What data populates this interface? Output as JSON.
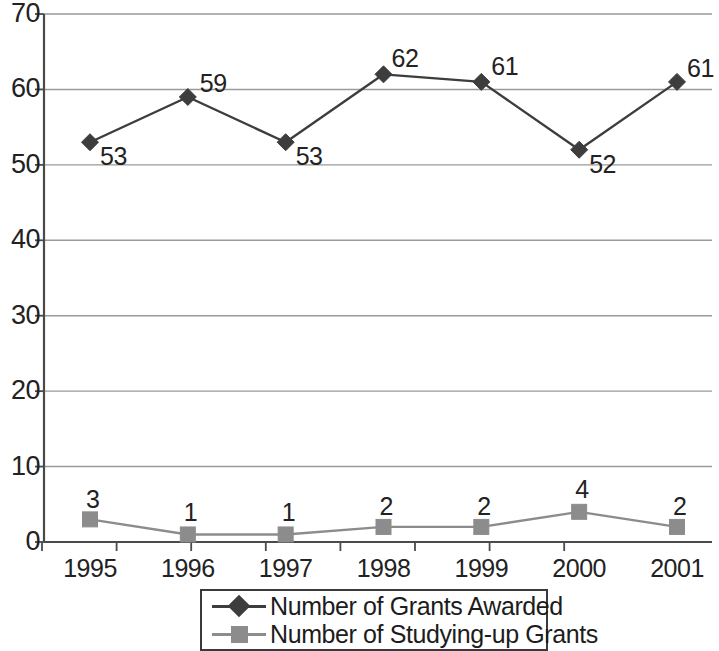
{
  "chart_data": {
    "type": "line",
    "title": "",
    "xlabel": "",
    "ylabel": "",
    "categories": [
      "1995",
      "1996",
      "1997",
      "1998",
      "1999",
      "2000",
      "2001"
    ],
    "series": [
      {
        "name": "Number of Grants Awarded",
        "marker": "diamond",
        "color": "#3d3d3d",
        "values": [
          53,
          59,
          53,
          62,
          61,
          52,
          61
        ],
        "label_offsets": [
          {
            "dx": 10,
            "dy": 2
          },
          {
            "dx": 12,
            "dy": -26
          },
          {
            "dx": 10,
            "dy": 2
          },
          {
            "dx": 8,
            "dy": -28
          },
          {
            "dx": 10,
            "dy": -28
          },
          {
            "dx": 10,
            "dy": 2
          },
          {
            "dx": 10,
            "dy": -26
          }
        ]
      },
      {
        "name": "Number of Studying-up Grants",
        "marker": "square",
        "color": "#8c8c8c",
        "values": [
          3,
          1,
          1,
          2,
          2,
          4,
          2
        ],
        "label_offsets": [
          {
            "dx": -4,
            "dy": -32
          },
          {
            "dx": -4,
            "dy": -34
          },
          {
            "dx": -4,
            "dy": -34
          },
          {
            "dx": -4,
            "dy": -33
          },
          {
            "dx": -4,
            "dy": -33
          },
          {
            "dx": -4,
            "dy": -35
          },
          {
            "dx": -4,
            "dy": -33
          }
        ]
      }
    ],
    "ylim": [
      0,
      70
    ],
    "yticks": [
      0,
      10,
      20,
      30,
      40,
      50,
      60,
      70
    ],
    "ytick_labels": [
      "0",
      "10",
      "20",
      "30",
      "40",
      "50",
      "60",
      "70"
    ],
    "grid": true,
    "grid_axis": "y",
    "grid_color": "#9a9a9a",
    "axis_color": "#4a4a4a",
    "legend_position": "bottom-center",
    "background": "#ffffff"
  },
  "legend": {
    "entries": [
      {
        "label": "Number of Grants Awarded",
        "marker": "diamond-marker",
        "color": "#3d3d3d"
      },
      {
        "label": "Number of Studying-up Grants",
        "marker": "square-marker",
        "color": "#8c8c8c"
      }
    ]
  }
}
